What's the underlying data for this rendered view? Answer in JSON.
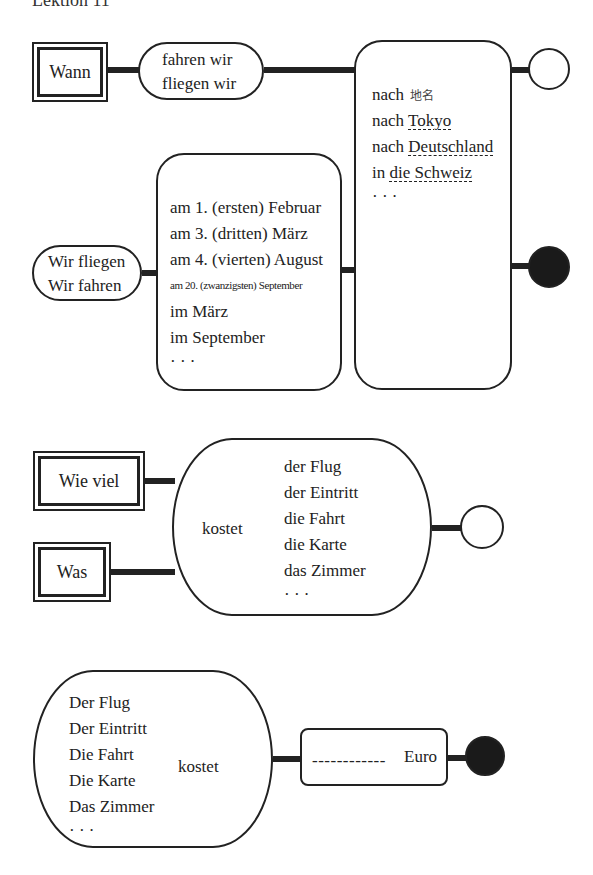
{
  "header": {
    "title": "Lektion 11"
  },
  "diagram1": {
    "question_word": "Wann",
    "verb_phrases": [
      "fahren wir",
      "fliegen wir"
    ],
    "answer_subject": [
      "Wir fliegen",
      "Wir fahren"
    ],
    "dates": [
      "am 1. (ersten) Februar",
      "am 3. (dritten) März",
      "am 4. (vierten) August",
      "am 20. (zwanzigsten) September",
      "im März",
      "im September",
      "· · ·"
    ],
    "destinations": {
      "line0_prefix": "nach",
      "line0_note": "地名",
      "line1_prefix": "nach ",
      "line1_place": "Tokyo",
      "line2_prefix": "nach ",
      "line2_place": "Deutschland",
      "line3_prefix": "in ",
      "line3_place": "die Schweiz",
      "ellipsis": "· · ·"
    },
    "end_question": "open-circle",
    "end_statement": "filled-circle"
  },
  "diagram2": {
    "question_words": [
      "Wie viel",
      "Was"
    ],
    "verb": "kostet",
    "nouns": [
      "der Flug",
      "der Eintritt",
      "die Fahrt",
      "die Karte",
      "das Zimmer",
      "· · ·"
    ],
    "end": "open-circle"
  },
  "diagram3": {
    "nouns": [
      "Der Flug",
      "Der Eintritt",
      "Die Fahrt",
      "Die Karte",
      "Das Zimmer",
      "· · ·"
    ],
    "verb": "kostet",
    "blank": "------------",
    "currency": "Euro",
    "end": "filled-circle"
  }
}
